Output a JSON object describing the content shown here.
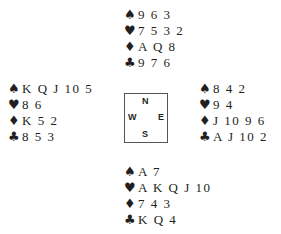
{
  "deal": {
    "north": {
      "spades": "9 6 3",
      "hearts": "7 5 3 2",
      "diamonds": "A Q 8",
      "clubs": "9 7 6"
    },
    "west": {
      "spades": "K Q J 10 5",
      "hearts": "8 6",
      "diamonds": "K 5 2",
      "clubs": "8 5 3"
    },
    "east": {
      "spades": "8 4 2",
      "hearts": "9 4",
      "diamonds": "J 10 9 6",
      "clubs": "A J 10 2"
    },
    "south": {
      "spades": "A 7",
      "hearts": "A K Q J 10",
      "diamonds": "7 4 3",
      "clubs": "K Q 4"
    }
  },
  "compass": {
    "n": "N",
    "e": "E",
    "s": "S",
    "w": "W"
  },
  "suits": {
    "spades": "♠",
    "hearts": "♥",
    "diamonds": "♦",
    "clubs": "♣"
  }
}
